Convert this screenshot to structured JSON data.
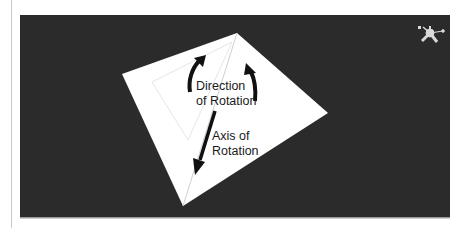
{
  "diagram": {
    "labels": {
      "direction_line1": "Direction",
      "direction_line2": "of Rotation",
      "axis_line1": "Axis of",
      "axis_line2": "Rotation"
    },
    "icons": {
      "gizmo": "orientation-gizmo-icon"
    },
    "colors": {
      "viewport_background": "#2b2b2b",
      "quad_fill": "#ffffff",
      "arrow": "#111111",
      "axis_line": "#cfcfcf",
      "gizmo": "#d9d9d9"
    }
  }
}
